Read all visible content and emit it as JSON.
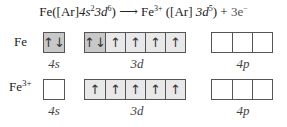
{
  "equation": {
    "reactant": "Fe",
    "reactant_config_prefix": "([Ar]",
    "reactant_4s": "4s",
    "reactant_4s_exp": "2",
    "reactant_3d": "3d",
    "reactant_3d_exp": "6",
    "reactant_close": ")",
    "arrow": "⟶",
    "product": "Fe",
    "product_charge": "3+",
    "product_config_prefix": "([Ar] ",
    "product_3d": "3d",
    "product_3d_exp": "5",
    "product_close": ")",
    "plus": "+",
    "electrons": "3e",
    "electron_charge": "−"
  },
  "rows": [
    {
      "species": "Fe",
      "charge": "",
      "orbitals": {
        "4s": [
          "↑↓"
        ],
        "3d": [
          "↑↓",
          "↑",
          "↑",
          "↑",
          "↑"
        ],
        "4p": [
          "",
          "",
          ""
        ]
      }
    },
    {
      "species": "Fe",
      "charge": "3+",
      "orbitals": {
        "4s": [
          ""
        ],
        "3d": [
          "↑",
          "↑",
          "↑",
          "↑",
          "↑"
        ],
        "4p": [
          "",
          "",
          ""
        ]
      }
    }
  ],
  "labels": {
    "s": "4s",
    "d": "3d",
    "p": "4p"
  },
  "colors": {
    "filled_dark": "#c8c8c8",
    "filled_light": "#e8e8e8",
    "empty": "#ffffff",
    "border": "#555555"
  }
}
